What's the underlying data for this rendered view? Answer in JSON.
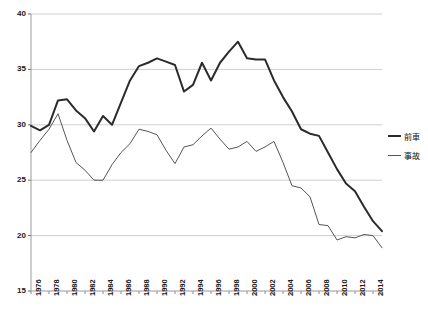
{
  "chart_data": {
    "type": "line",
    "title": "",
    "subtitle": "",
    "xlabel": "",
    "ylabel": "",
    "xlim": [
      1976,
      2015
    ],
    "ylim": [
      15,
      40
    ],
    "yticks": [
      15,
      20,
      25,
      30,
      35,
      40
    ],
    "xticks": [
      1976,
      1978,
      1980,
      1982,
      1984,
      1986,
      1988,
      1990,
      1992,
      1994,
      1996,
      1998,
      2000,
      2002,
      2004,
      2006,
      2008,
      2010,
      2012,
      2014
    ],
    "grid": "horizontal",
    "legend_position": "right",
    "x": [
      1976,
      1977,
      1978,
      1979,
      1980,
      1981,
      1982,
      1983,
      1984,
      1985,
      1986,
      1987,
      1988,
      1989,
      1990,
      1991,
      1992,
      1993,
      1994,
      1995,
      1996,
      1997,
      1998,
      1999,
      2000,
      2001,
      2002,
      2003,
      2004,
      2005,
      2006,
      2007,
      2008,
      2009,
      2010,
      2011,
      2012,
      2013,
      2014,
      2015
    ],
    "series": [
      {
        "name": "前車",
        "color": "#2b2b2b",
        "width": 2.0,
        "values": [
          29.9,
          29.5,
          30.0,
          32.2,
          32.3,
          31.3,
          30.6,
          29.4,
          30.8,
          30.0,
          32.0,
          34.0,
          35.3,
          35.6,
          36.0,
          35.7,
          35.4,
          33.0,
          33.6,
          35.6,
          34.0,
          35.6,
          36.6,
          37.5,
          36.0,
          35.9,
          35.9,
          34.0,
          32.5,
          31.2,
          29.6,
          29.2,
          29.0,
          27.5,
          26.0,
          24.7,
          24.0,
          22.6,
          21.3,
          20.4
        ]
      },
      {
        "name": "事故",
        "color": "#555555",
        "width": 1.0,
        "values": [
          27.5,
          28.6,
          29.6,
          31.0,
          28.6,
          26.6,
          25.9,
          25.0,
          25.0,
          26.4,
          27.5,
          28.3,
          29.6,
          29.4,
          29.1,
          27.7,
          26.5,
          28.0,
          28.2,
          29.0,
          29.7,
          28.7,
          27.8,
          28.0,
          28.5,
          27.6,
          28.0,
          28.5,
          26.6,
          24.5,
          24.3,
          23.5,
          21.0,
          20.9,
          19.6,
          19.9,
          19.8,
          20.1,
          20.0,
          18.9
        ]
      }
    ]
  },
  "legend": {
    "items": [
      {
        "label": "前車",
        "color": "#2b2b2b"
      },
      {
        "label": "事故",
        "color": "#555555"
      }
    ]
  },
  "axes": {
    "y_labels": [
      "40",
      "35",
      "30",
      "25",
      "20",
      "15"
    ],
    "x_labels": [
      "1976",
      "1978",
      "1980",
      "1982",
      "1984",
      "1986",
      "1988",
      "1990",
      "1992",
      "1994",
      "1996",
      "1998",
      "2000",
      "2002",
      "2004",
      "2006",
      "2008",
      "2010",
      "2012",
      "2014"
    ]
  }
}
